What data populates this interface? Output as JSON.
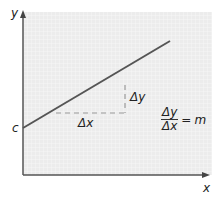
{
  "diagram": {
    "axes": {
      "x_label": "x",
      "y_label": "y"
    },
    "intercept_label": "c",
    "delta_x_label": "Δx",
    "delta_y_label": "Δy",
    "formula": {
      "numerator": "Δy",
      "denominator": "Δx",
      "equals": "=",
      "result": "m"
    },
    "colors": {
      "background_grid": "#ececec",
      "grid_lines": "#f8f8f8",
      "line": "#555555",
      "axes": "#555555",
      "dashed": "#9a9a9a",
      "text": "#222222"
    }
  }
}
